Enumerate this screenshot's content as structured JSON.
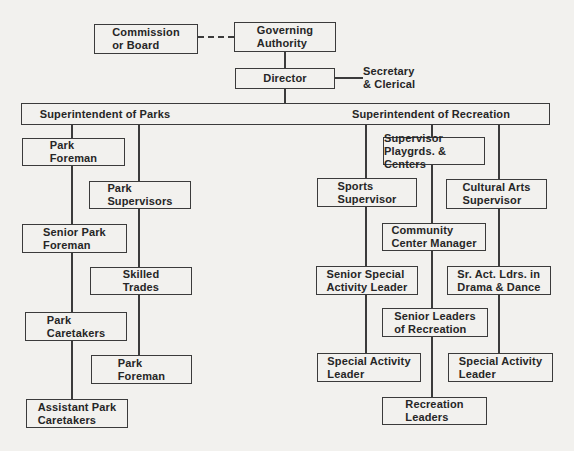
{
  "canvas": {
    "width": 574,
    "height": 451,
    "background": "#f2f1ee",
    "ink": "#3b3b3b",
    "text_color": "#262626"
  },
  "org_chart": {
    "type": "org-chart",
    "bar": {
      "parks_label": "Superintendent of Parks",
      "recreation_label": "Superintendent of Recreation",
      "x": 21,
      "y": 103,
      "w": 529,
      "h": 22,
      "parks_label_cx": 83,
      "recreation_label_cx": 409
    },
    "nodes": [
      {
        "id": "commission-or-board",
        "label": "Commission\nor Board",
        "x": 94,
        "y": 24,
        "w": 104,
        "h": 30
      },
      {
        "id": "governing-authority",
        "label": "Governing\nAuthority",
        "x": 234,
        "y": 22,
        "w": 102,
        "h": 30
      },
      {
        "id": "director",
        "label": "Director",
        "x": 235,
        "y": 68,
        "w": 100,
        "h": 21
      },
      {
        "id": "secretary-clerical",
        "label": "Secretary\n& Clerical",
        "x": 363,
        "y": 65,
        "w": 62,
        "h": 28,
        "plain": true
      },
      {
        "id": "park-foreman-upper",
        "label": "Park\nForeman",
        "x": 22,
        "y": 138,
        "w": 103,
        "h": 28
      },
      {
        "id": "park-supervisors",
        "label": "Park\nSupervisors",
        "x": 89,
        "y": 181,
        "w": 102,
        "h": 28
      },
      {
        "id": "senior-park-foreman",
        "label": "Senior Park\nForeman",
        "x": 22,
        "y": 224,
        "w": 105,
        "h": 29
      },
      {
        "id": "skilled-trades",
        "label": "Skilled\nTrades",
        "x": 90,
        "y": 267,
        "w": 102,
        "h": 28
      },
      {
        "id": "park-caretakers",
        "label": "Park\nCaretakers",
        "x": 25,
        "y": 312,
        "w": 102,
        "h": 29
      },
      {
        "id": "park-foreman-lower",
        "label": "Park\nForeman",
        "x": 91,
        "y": 355,
        "w": 101,
        "h": 29
      },
      {
        "id": "assistant-park-caretakers",
        "label": "Assistant Park\nCaretakers",
        "x": 26,
        "y": 399,
        "w": 102,
        "h": 29
      },
      {
        "id": "supervisor-playgrds-centers",
        "label": "Supervisor\nPlaygrds. & Centers",
        "x": 383,
        "y": 137,
        "w": 102,
        "h": 28
      },
      {
        "id": "sports-supervisor",
        "label": "Sports\nSupervisor",
        "x": 317,
        "y": 178,
        "w": 100,
        "h": 29
      },
      {
        "id": "cultural-arts-supervisor",
        "label": "Cultural Arts\nSupervisor",
        "x": 446,
        "y": 179,
        "w": 101,
        "h": 30
      },
      {
        "id": "community-center-manager",
        "label": "Community\nCenter Manager",
        "x": 382,
        "y": 223,
        "w": 104,
        "h": 28
      },
      {
        "id": "senior-special-activity-leader",
        "label": "Senior Special\nActivity Leader",
        "x": 316,
        "y": 266,
        "w": 102,
        "h": 29
      },
      {
        "id": "sr-act-ldrs-in-drama-dance",
        "label": "Sr. Act. Ldrs. in\nDrama & Dance",
        "x": 447,
        "y": 266,
        "w": 104,
        "h": 29
      },
      {
        "id": "senior-leaders-of-recreation",
        "label": "Senior Leaders\nof Recreation",
        "x": 382,
        "y": 308,
        "w": 106,
        "h": 29
      },
      {
        "id": "special-activity-leader-west",
        "label": "Special Activity\nLeader",
        "x": 317,
        "y": 353,
        "w": 104,
        "h": 29
      },
      {
        "id": "special-activity-leader-east",
        "label": "Special Activity\nLeader",
        "x": 448,
        "y": 353,
        "w": 105,
        "h": 29
      },
      {
        "id": "recreation-leaders",
        "label": "Recreation\nLeaders",
        "x": 382,
        "y": 397,
        "w": 105,
        "h": 28
      }
    ],
    "edges": [
      {
        "id": "commission-governing-dashed-line",
        "kind": "dash",
        "x": 198,
        "y": 36,
        "len": 36
      },
      {
        "id": "governing-director-line",
        "kind": "v",
        "x": 284,
        "y": 52,
        "len": 17
      },
      {
        "id": "director-secretary-line",
        "kind": "h",
        "x": 335,
        "y": 77,
        "len": 28
      },
      {
        "id": "director-superintendents-line",
        "kind": "v",
        "x": 284,
        "y": 88,
        "len": 16
      },
      {
        "id": "parks-left-column-line",
        "kind": "v",
        "x": 71,
        "y": 124,
        "len": 277
      },
      {
        "id": "parks-right-column-line",
        "kind": "v",
        "x": 138,
        "y": 124,
        "len": 233
      },
      {
        "id": "recreation-left-column-line",
        "kind": "v",
        "x": 365,
        "y": 124,
        "len": 231
      },
      {
        "id": "recreation-middle-column-line",
        "kind": "v",
        "x": 431,
        "y": 124,
        "len": 275
      },
      {
        "id": "recreation-right-column-line",
        "kind": "v",
        "x": 498,
        "y": 124,
        "len": 231
      }
    ]
  }
}
